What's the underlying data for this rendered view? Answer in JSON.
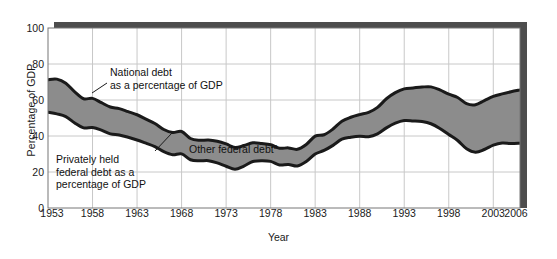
{
  "chart_data": {
    "type": "area",
    "title": "",
    "xlabel": "Year",
    "ylabel": "Percentage of GDP",
    "xlim": [
      1953,
      2006
    ],
    "ylim": [
      0,
      100
    ],
    "grid": true,
    "legend_position": "inline-annotations",
    "xticks": [
      "1953",
      "1958",
      "1963",
      "1968",
      "1973",
      "1978",
      "1983",
      "1988",
      "1993",
      "1998",
      "2003",
      "2006"
    ],
    "xtick_values": [
      1953,
      1958,
      1963,
      1968,
      1973,
      1978,
      1983,
      1988,
      1993,
      1998,
      2003,
      2006
    ],
    "yticks": [
      "0",
      "20",
      "40",
      "60",
      "80",
      "100"
    ],
    "ytick_values": [
      0,
      20,
      40,
      60,
      80,
      100
    ],
    "x": [
      1953,
      1954,
      1955,
      1956,
      1957,
      1958,
      1959,
      1960,
      1961,
      1962,
      1963,
      1964,
      1965,
      1966,
      1967,
      1968,
      1969,
      1970,
      1971,
      1972,
      1973,
      1974,
      1975,
      1976,
      1977,
      1978,
      1979,
      1980,
      1981,
      1982,
      1983,
      1984,
      1985,
      1986,
      1987,
      1988,
      1989,
      1990,
      1991,
      1992,
      1993,
      1994,
      1995,
      1996,
      1997,
      1998,
      1999,
      2000,
      2001,
      2002,
      2003,
      2004,
      2005,
      2006
    ],
    "series": [
      {
        "name": "National debt as a percentage of GDP",
        "fill": "none",
        "values": [
          71.3,
          71.6,
          69.3,
          64.5,
          60.7,
          60.9,
          58.5,
          56.1,
          55.2,
          53.5,
          51.8,
          49.4,
          46.9,
          43.6,
          41.9,
          42.5,
          38.6,
          37.6,
          37.8,
          37.1,
          35.6,
          33.6,
          34.7,
          36.2,
          35.8,
          35.1,
          33.2,
          33.4,
          32.6,
          35.3,
          39.9,
          40.7,
          43.9,
          48.2,
          50.4,
          51.9,
          53.1,
          55.9,
          60.7,
          64.1,
          66.2,
          66.7,
          67.2,
          67.3,
          65.6,
          63.2,
          61.4,
          58.0,
          57.4,
          59.7,
          62.0,
          63.4,
          64.6,
          65.6
        ]
      },
      {
        "name": "Privately held federal debt as a percentage of GDP",
        "fill": "none",
        "values": [
          53.2,
          52.3,
          50.8,
          47.2,
          44.5,
          44.7,
          43.3,
          41.2,
          40.6,
          39.3,
          37.8,
          36.0,
          34.1,
          31.3,
          29.6,
          30.1,
          26.8,
          26.2,
          26.3,
          25.1,
          23.2,
          21.5,
          23.3,
          25.8,
          26.3,
          25.9,
          23.9,
          24.2,
          23.3,
          25.8,
          30.0,
          32.0,
          34.8,
          38.2,
          39.3,
          39.9,
          39.6,
          41.2,
          44.5,
          47.1,
          48.6,
          48.4,
          48.0,
          46.8,
          44.2,
          40.8,
          37.5,
          32.9,
          31.0,
          32.5,
          34.9,
          36.1,
          35.8,
          36.0
        ]
      }
    ],
    "shaded_band_label": "Other federal debt",
    "shaded_band_note": "a",
    "band_color": "#8c8c8c",
    "line_color": "#1a1a1a",
    "grid_color": "#c8c8c8",
    "shadow_color": "#4d4d4d"
  },
  "annotations": [
    {
      "id": "national",
      "text": "National debt\nas a percentage of GDP"
    },
    {
      "id": "private",
      "text": "Privately held\nfederal debt as a\npercentage of GDP"
    },
    {
      "id": "other",
      "text": "Other federal debt",
      "superscript": "a"
    }
  ]
}
